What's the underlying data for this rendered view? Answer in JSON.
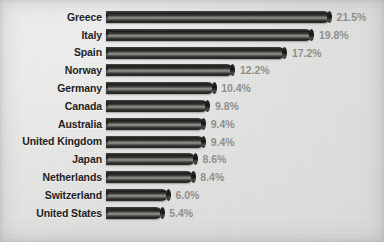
{
  "chart_data": {
    "type": "bar",
    "orientation": "horizontal",
    "title": "",
    "subtitle": "",
    "xlabel": "",
    "ylabel": "",
    "grid": false,
    "legend": null,
    "value_suffix": "%",
    "xlim": [
      0,
      21.5
    ],
    "categories": [
      "Greece",
      "Italy",
      "Spain",
      "Norway",
      "Germany",
      "Canada",
      "Australia",
      "United Kingdom",
      "Japan",
      "Netherlands",
      "Switzerland",
      "United States"
    ],
    "values": [
      21.5,
      19.8,
      17.2,
      12.2,
      10.4,
      9.8,
      9.4,
      9.4,
      8.6,
      8.4,
      6.0,
      5.4
    ],
    "value_labels": [
      "21.5%",
      "19.8%",
      "17.2%",
      "12.2%",
      "10.4%",
      "9.8%",
      "9.4%",
      "9.4%",
      "8.6%",
      "8.4%",
      "6.0%",
      "5.4%"
    ],
    "bars": [
      {
        "label": "Greece",
        "value": 21.5,
        "value_label": "21.5%"
      },
      {
        "label": "Italy",
        "value": 19.8,
        "value_label": "19.8%"
      },
      {
        "label": "Spain",
        "value": 17.2,
        "value_label": "17.2%"
      },
      {
        "label": "Norway",
        "value": 12.2,
        "value_label": "12.2%"
      },
      {
        "label": "Germany",
        "value": 10.4,
        "value_label": "10.4%"
      },
      {
        "label": "Canada",
        "value": 9.8,
        "value_label": "9.8%"
      },
      {
        "label": "Australia",
        "value": 9.4,
        "value_label": "9.4%"
      },
      {
        "label": "United Kingdom",
        "value": 9.4,
        "value_label": "9.4%"
      },
      {
        "label": "Japan",
        "value": 8.6,
        "value_label": "8.6%"
      },
      {
        "label": "Netherlands",
        "value": 8.4,
        "value_label": "8.4%"
      },
      {
        "label": "Switzerland",
        "value": 6.0,
        "value_label": "6.0%"
      },
      {
        "label": "United States",
        "value": 5.4,
        "value_label": "5.4%"
      }
    ]
  },
  "style": {
    "background_color": "#e3e3e1",
    "bar_color": "#1d1d1c",
    "bar_highlight_color": "#9b9b97",
    "category_label_color": "#1b1b1b",
    "value_label_color": "#8d8d8a"
  },
  "layout": {
    "bar_origin_x": 110,
    "px_per_unit": 10.4,
    "row_pitch": 17.8,
    "first_row_top": 8,
    "bar_height": 12
  }
}
